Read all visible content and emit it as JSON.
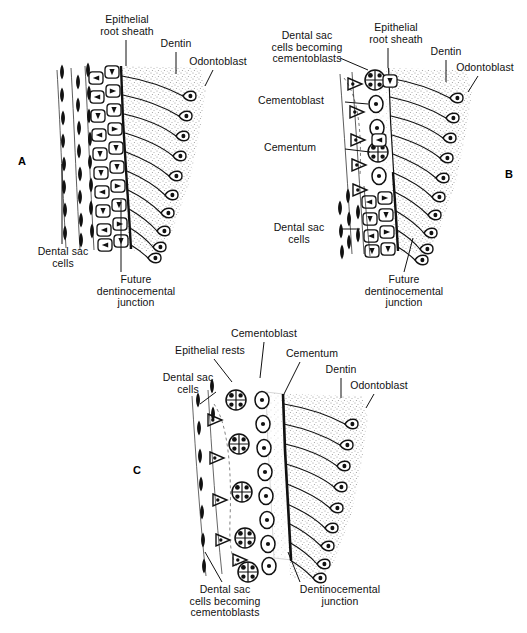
{
  "figure": {
    "background_color": "#ffffff",
    "ink_color": "#111111",
    "dentin_stipple_color": "#b9b9b9",
    "cementum_color": "#dedede",
    "width": 527,
    "height": 633
  },
  "panels": [
    {
      "id": "A",
      "letter": "A",
      "letter_pos": {
        "x": 18,
        "y": 155
      },
      "caption": "Intact epithelial root sheath adjacent to newly formed dentin",
      "labels": [
        {
          "name": "epithelial-root-sheath",
          "text": "Epithelial\nroot sheath",
          "x": 72,
          "y": 14,
          "w": 110,
          "leader": {
            "x1": 126,
            "y1": 40,
            "x2": 126,
            "y2": 66
          }
        },
        {
          "name": "dentin",
          "text": "Dentin",
          "x": 146,
          "y": 38,
          "w": 60,
          "leader": {
            "x1": 176,
            "y1": 52,
            "x2": 176,
            "y2": 74
          }
        },
        {
          "name": "odontoblast",
          "text": "Odontoblast",
          "x": 173,
          "y": 56,
          "w": 90,
          "leader": {
            "x1": 213,
            "y1": 70,
            "x2": 205,
            "y2": 86
          }
        },
        {
          "name": "dental-sac-cells",
          "text": "Dental  sac\ncells",
          "x": 18,
          "y": 246,
          "w": 90,
          "leader": {
            "x1": 62,
            "y1": 244,
            "x2": 62,
            "y2": 164
          }
        },
        {
          "name": "future-dentinocemental-junction",
          "text": "Future\ndentinocemental\njunction",
          "x": 76,
          "y": 274,
          "w": 120,
          "leader": {
            "x1": 121,
            "y1": 272,
            "x2": 121,
            "y2": 200
          }
        }
      ]
    },
    {
      "id": "B",
      "letter": "B",
      "letter_pos": {
        "x": 505,
        "y": 168
      },
      "caption": "Fragmentation of the root sheath; dental sac cells become cementoblasts and deposit cementum",
      "labels": [
        {
          "name": "dental-sac-cells-becoming-cementoblasts",
          "text": "Dental  sac\ncells  becoming\ncementoblasts",
          "x": 255,
          "y": 30,
          "w": 104,
          "leader": {
            "x1": 340,
            "y1": 58,
            "x2": 368,
            "y2": 70
          }
        },
        {
          "name": "epithelial-root-sheath",
          "text": "Epithelial\nroot sheath",
          "x": 345,
          "y": 22,
          "w": 102,
          "leader": {
            "x1": 388,
            "y1": 48,
            "x2": 388,
            "y2": 68
          }
        },
        {
          "name": "dentin",
          "text": "Dentin",
          "x": 418,
          "y": 46,
          "w": 56,
          "leader": {
            "x1": 446,
            "y1": 60,
            "x2": 446,
            "y2": 82
          }
        },
        {
          "name": "odontoblast",
          "text": "Odontoblast",
          "x": 443,
          "y": 62,
          "w": 84,
          "leader": {
            "x1": 478,
            "y1": 76,
            "x2": 468,
            "y2": 92
          }
        },
        {
          "name": "cementoblast",
          "text": "Cementoblast",
          "x": 258,
          "y": 95,
          "w": 100,
          "leader": {
            "x1": 345,
            "y1": 102,
            "x2": 370,
            "y2": 104
          }
        },
        {
          "name": "cementum",
          "text": "Cementum",
          "x": 264,
          "y": 142,
          "w": 92,
          "leader": {
            "x1": 345,
            "y1": 149,
            "x2": 372,
            "y2": 152
          }
        },
        {
          "name": "dental-sac-cells",
          "text": "Dental  sac\ncells",
          "x": 253,
          "y": 222,
          "w": 92,
          "leader": {
            "x1": 340,
            "y1": 229,
            "x2": 362,
            "y2": 229
          }
        },
        {
          "name": "future-dentinocemental-junction",
          "text": "Future\ndentinocemental\njunction",
          "x": 344,
          "y": 274,
          "w": 120,
          "leader": {
            "x1": 404,
            "y1": 272,
            "x2": 413,
            "y2": 238
          }
        }
      ]
    },
    {
      "id": "C",
      "letter": "C",
      "letter_pos": {
        "x": 133,
        "y": 464
      },
      "caption": "Cementum layer established; epithelial rests persist in the dental sac",
      "labels": [
        {
          "name": "cementoblast",
          "text": "Cementoblast",
          "x": 214,
          "y": 328,
          "w": 100,
          "leader": {
            "x1": 264,
            "y1": 342,
            "x2": 260,
            "y2": 378
          }
        },
        {
          "name": "epithelial-rests",
          "text": "Epithelial  rests",
          "x": 155,
          "y": 345,
          "w": 110,
          "leader": {
            "x1": 214,
            "y1": 359,
            "x2": 232,
            "y2": 382
          }
        },
        {
          "name": "cementum",
          "text": "Cementum",
          "x": 268,
          "y": 348,
          "w": 88,
          "leader": {
            "x1": 300,
            "y1": 362,
            "x2": 284,
            "y2": 394
          }
        },
        {
          "name": "dentin",
          "text": "Dentin",
          "x": 312,
          "y": 364,
          "w": 58,
          "leader": {
            "x1": 341,
            "y1": 378,
            "x2": 341,
            "y2": 398
          }
        },
        {
          "name": "odontoblast",
          "text": "Odontoblast",
          "x": 336,
          "y": 380,
          "w": 86,
          "leader": {
            "x1": 374,
            "y1": 394,
            "x2": 366,
            "y2": 408
          }
        },
        {
          "name": "dental-sac-cells",
          "text": "Dental  sac\ncells",
          "x": 144,
          "y": 372,
          "w": 88,
          "leader": {
            "x1": 216,
            "y1": 392,
            "x2": 200,
            "y2": 404
          }
        },
        {
          "name": "dental-sac-cells-becoming-cementoblasts",
          "text": "Dental  sac\ncells  becoming\ncementoblasts",
          "x": 169,
          "y": 584,
          "w": 112,
          "leader": {
            "x1": 222,
            "y1": 582,
            "x2": 205,
            "y2": 552
          }
        },
        {
          "name": "dentinocemental-junction",
          "text": "Dentinocemental\njunction",
          "x": 281,
          "y": 584,
          "w": 118,
          "leader": {
            "x1": 300,
            "y1": 582,
            "x2": 288,
            "y2": 552
          }
        }
      ]
    }
  ],
  "legend_terms": [
    "Epithelial root sheath",
    "Dentin",
    "Odontoblast",
    "Dental sac cells",
    "Future dentinocemental junction",
    "Dental sac cells becoming cementoblasts",
    "Cementoblast",
    "Cementum",
    "Epithelial rests",
    "Dentinocemental junction"
  ]
}
